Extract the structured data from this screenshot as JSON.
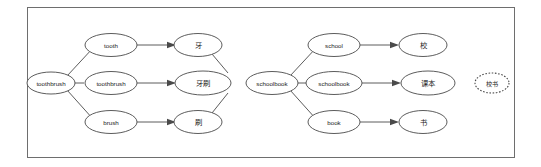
{
  "figure": {
    "frame": {
      "visible": true,
      "stroke": "#6e6e6e"
    },
    "groups": [
      {
        "id": "toothbrush-group",
        "source_node": {
          "id": "src-toothbrush",
          "label": "toothbrush",
          "lang": "en"
        },
        "segment_nodes": [
          {
            "id": "seg-tooth",
            "label": "tooth",
            "lang": "en"
          },
          {
            "id": "seg-toothbrush",
            "label": "toothbrush",
            "lang": "en"
          },
          {
            "id": "seg-brush",
            "label": "brush",
            "lang": "en"
          }
        ],
        "target_nodes": [
          {
            "id": "tgt-ya",
            "label": "牙",
            "lang": "zh"
          },
          {
            "id": "tgt-yashua",
            "label": "牙刷",
            "lang": "zh"
          },
          {
            "id": "tgt-shua",
            "label": "刷",
            "lang": "zh"
          }
        ],
        "extra_nodes": []
      },
      {
        "id": "schoolbook-group",
        "source_node": {
          "id": "src-schoolbook",
          "label": "schoolbook",
          "lang": "en"
        },
        "segment_nodes": [
          {
            "id": "seg-school",
            "label": "school",
            "lang": "en"
          },
          {
            "id": "seg-schoolbook",
            "label": "schoolbook",
            "lang": "en"
          },
          {
            "id": "seg-book",
            "label": "book",
            "lang": "en"
          }
        ],
        "target_nodes": [
          {
            "id": "tgt-xiao",
            "label": "校",
            "lang": "zh"
          },
          {
            "id": "tgt-keben",
            "label": "课本",
            "lang": "zh"
          },
          {
            "id": "tgt-shu",
            "label": "书",
            "lang": "zh"
          }
        ],
        "extra_nodes": [
          {
            "id": "tgt-xiaoshu",
            "label": "校书",
            "lang": "zh",
            "style": "dotted"
          }
        ]
      }
    ],
    "colors": {
      "frame_stroke": "#6e6e6e",
      "node_stroke": "#4a4a4a",
      "node_fill": "#ffffff",
      "text": "#1a1a1a",
      "background": "#ffffff"
    }
  }
}
